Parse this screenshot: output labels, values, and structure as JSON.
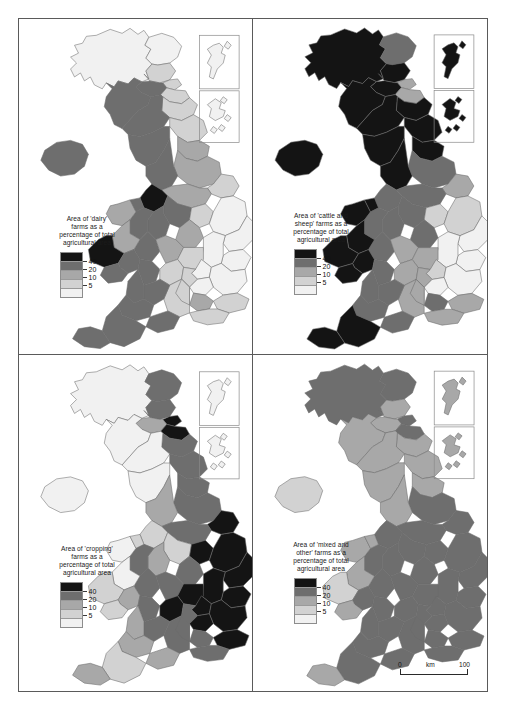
{
  "figure": {
    "panel_count": 4,
    "border_color": "#5a5a5a"
  },
  "legend_classes": [
    {
      "label": "40",
      "color": "#141414",
      "range": "over 40"
    },
    {
      "label": "20",
      "color": "#6e6e6e",
      "range": "20 to 40"
    },
    {
      "label": "10",
      "color": "#a8a8a8",
      "range": "10 to 20"
    },
    {
      "label": "5",
      "color": "#d2d2d2",
      "range": "5 to 10"
    },
    {
      "label": "",
      "color": "#f1f1f1",
      "range": "under 5"
    }
  ],
  "scalebar": {
    "left_label": "0",
    "unit_label": "km",
    "right_label": "100"
  },
  "panels": [
    {
      "id": "dairy",
      "legend_title": "Area of 'dairy'\nfarms as a\npercentage of total\nagricultural area",
      "inset_labels": [
        "shetland-inset",
        "orkney-inset"
      ]
    },
    {
      "id": "cattle-and-sheep",
      "legend_title": "Area of 'cattle and\nsheep' farms as a\npercentage of total\nagricultural area",
      "inset_labels": [
        "shetland-inset",
        "orkney-inset"
      ]
    },
    {
      "id": "cropping",
      "legend_title": "Area of 'cropping'\nfarms as a\npercentage of total\nagricultural area",
      "inset_labels": [
        "shetland-inset",
        "orkney-inset"
      ]
    },
    {
      "id": "mixed-and-other",
      "legend_title": "Area of 'mixed and\nother' farms as a\npercentage of total\nagricultural area",
      "inset_labels": [
        "shetland-inset",
        "orkney-inset"
      ]
    }
  ],
  "chart_data": {
    "type": "heatmap",
    "subtitle": "Choropleth maps of the United Kingdom, four farm types",
    "legend_breaks": [
      5,
      10,
      20,
      40
    ],
    "legend_position": "lower-left of each panel",
    "regions": [
      "Highland",
      "Grampian",
      "Tayside",
      "Fife",
      "Central",
      "Lothian",
      "Strathclyde",
      "Borders",
      "Dumfries and Galloway",
      "Northern Ireland",
      "Northumberland",
      "Cumbria",
      "Durham",
      "North Yorkshire",
      "Humberside",
      "Lancashire",
      "West Yorkshire",
      "Cheshire",
      "Derbyshire",
      "Nottinghamshire",
      "Lincolnshire",
      "Staffordshire",
      "Leicestershire",
      "Norfolk",
      "Suffolk",
      "Cambridgeshire",
      "Shropshire",
      "Hereford and Worcester",
      "Warwickshire",
      "Northamptonshire",
      "Bedfordshire",
      "Essex",
      "Gwynedd",
      "Clwyd",
      "Powys",
      "Dyfed",
      "Gwent",
      "Glamorgan",
      "Gloucestershire",
      "Oxfordshire",
      "Buckinghamshire",
      "Hertfordshire",
      "Kent",
      "Surrey",
      "Sussex",
      "Hampshire",
      "Berkshire",
      "Wiltshire",
      "Avon",
      "Somerset",
      "Dorset",
      "Devon",
      "Cornwall",
      "Shetland",
      "Orkney"
    ],
    "series": [
      {
        "name": "dairy",
        "title": "Area of 'dairy' farms as a percentage of total agricultural area",
        "values": {
          "Highland": 2,
          "Grampian": 4,
          "Tayside": 5,
          "Fife": 8,
          "Central": 22,
          "Lothian": 6,
          "Strathclyde": 28,
          "Borders": 5,
          "Dumfries and Galloway": 30,
          "Northern Ireland": 28,
          "Northumberland": 7,
          "Cumbria": 30,
          "Durham": 12,
          "North Yorkshire": 14,
          "Humberside": 5,
          "Lancashire": 33,
          "West Yorkshire": 16,
          "Cheshire": 48,
          "Derbyshire": 30,
          "Nottinghamshire": 8,
          "Lincolnshire": 3,
          "Staffordshire": 30,
          "Leicestershire": 12,
          "Norfolk": 2,
          "Suffolk": 2,
          "Cambridgeshire": 2,
          "Shropshire": 26,
          "Hereford and Worcester": 20,
          "Warwickshire": 14,
          "Northamptonshire": 8,
          "Bedfordshire": 3,
          "Essex": 2,
          "Gwynedd": 13,
          "Clwyd": 25,
          "Powys": 18,
          "Dyfed": 45,
          "Gwent": 22,
          "Glamorgan": 22,
          "Gloucestershire": 20,
          "Oxfordshire": 7,
          "Buckinghamshire": 9,
          "Hertfordshire": 3,
          "Kent": 6,
          "Surrey": 10,
          "Sussex": 9,
          "Hampshire": 8,
          "Berkshire": 8,
          "Wiltshire": 24,
          "Avon": 24,
          "Somerset": 30,
          "Dorset": 26,
          "Devon": 26,
          "Cornwall": 28,
          "Shetland": 1,
          "Orkney": 2
        }
      },
      {
        "name": "cattle-and-sheep",
        "title": "Area of 'cattle and sheep' farms as a percentage of total agricultural area",
        "values": {
          "Highland": 70,
          "Grampian": 30,
          "Tayside": 42,
          "Fife": 14,
          "Central": 60,
          "Lothian": 16,
          "Strathclyde": 72,
          "Borders": 55,
          "Dumfries and Galloway": 55,
          "Northern Ireland": 60,
          "Northumberland": 55,
          "Cumbria": 70,
          "Durham": 45,
          "North Yorkshire": 30,
          "Humberside": 12,
          "Lancashire": 45,
          "West Yorkshire": 32,
          "Cheshire": 22,
          "Derbyshire": 30,
          "Nottinghamshire": 9,
          "Lincolnshire": 5,
          "Staffordshire": 24,
          "Leicestershire": 22,
          "Norfolk": 4,
          "Suffolk": 4,
          "Cambridgeshire": 3,
          "Shropshire": 26,
          "Hereford and Worcester": 25,
          "Warwickshire": 16,
          "Northamptonshire": 14,
          "Bedfordshire": 5,
          "Essex": 4,
          "Gwynedd": 70,
          "Clwyd": 48,
          "Powys": 65,
          "Dyfed": 40,
          "Gwent": 42,
          "Glamorgan": 48,
          "Gloucestershire": 22,
          "Oxfordshire": 10,
          "Buckinghamshire": 12,
          "Hertfordshire": 4,
          "Kent": 12,
          "Surrey": 20,
          "Sussex": 16,
          "Hampshire": 12,
          "Berkshire": 12,
          "Wiltshire": 20,
          "Avon": 24,
          "Somerset": 30,
          "Dorset": 26,
          "Devon": 42,
          "Cornwall": 42,
          "Shetland": 85,
          "Orkney": 75
        }
      },
      {
        "name": "cropping",
        "title": "Area of 'cropping' farms as a percentage of total agricultural area",
        "values": {
          "Highland": 2,
          "Grampian": 22,
          "Tayside": 35,
          "Fife": 45,
          "Central": 12,
          "Lothian": 46,
          "Strathclyde": 4,
          "Borders": 24,
          "Dumfries and Galloway": 4,
          "Northern Ireland": 4,
          "Northumberland": 22,
          "Cumbria": 4,
          "Durham": 25,
          "North Yorkshire": 30,
          "Humberside": 55,
          "Lancashire": 14,
          "West Yorkshire": 24,
          "Cheshire": 6,
          "Derbyshire": 8,
          "Nottinghamshire": 45,
          "Lincolnshire": 65,
          "Staffordshire": 14,
          "Leicestershire": 28,
          "Norfolk": 70,
          "Suffolk": 70,
          "Cambridgeshire": 72,
          "Shropshire": 20,
          "Hereford and Worcester": 22,
          "Warwickshire": 35,
          "Northamptonshire": 42,
          "Bedfordshire": 60,
          "Essex": 68,
          "Gwynedd": 3,
          "Clwyd": 8,
          "Powys": 4,
          "Dyfed": 5,
          "Gwent": 14,
          "Glamorgan": 8,
          "Gloucestershire": 22,
          "Oxfordshire": 42,
          "Buckinghamshire": 38,
          "Hertfordshire": 62,
          "Kent": 42,
          "Surrey": 22,
          "Sussex": 30,
          "Hampshire": 35,
          "Berkshire": 35,
          "Wiltshire": 24,
          "Avon": 18,
          "Somerset": 10,
          "Dorset": 18,
          "Devon": 8,
          "Cornwall": 12,
          "Shetland": 1,
          "Orkney": 2
        }
      },
      {
        "name": "mixed-and-other",
        "title": "Area of 'mixed and other' farms as a percentage of total agricultural area",
        "values": {
          "Highland": 24,
          "Grampian": 26,
          "Tayside": 18,
          "Fife": 22,
          "Central": 14,
          "Lothian": 24,
          "Strathclyde": 12,
          "Borders": 16,
          "Dumfries and Galloway": 10,
          "Northern Ireland": 8,
          "Northumberland": 14,
          "Cumbria": 12,
          "Durham": 16,
          "North Yorkshire": 22,
          "Humberside": 22,
          "Lancashire": 10,
          "West Yorkshire": 24,
          "Cheshire": 22,
          "Derbyshire": 26,
          "Nottinghamshire": 30,
          "Lincolnshire": 22,
          "Staffordshire": 26,
          "Leicestershire": 30,
          "Norfolk": 22,
          "Suffolk": 22,
          "Cambridgeshire": 20,
          "Shropshire": 26,
          "Hereford and Worcester": 30,
          "Warwickshire": 30,
          "Northamptonshire": 30,
          "Bedfordshire": 26,
          "Essex": 22,
          "Gwynedd": 12,
          "Clwyd": 16,
          "Powys": 12,
          "Dyfed": 9,
          "Gwent": 20,
          "Glamorgan": 18,
          "Gloucestershire": 30,
          "Oxfordshire": 30,
          "Buckinghamshire": 28,
          "Hertfordshire": 24,
          "Kent": 26,
          "Surrey": 30,
          "Sussex": 26,
          "Hampshire": 30,
          "Berkshire": 30,
          "Wiltshire": 28,
          "Avon": 28,
          "Somerset": 26,
          "Dorset": 28,
          "Devon": 20,
          "Cornwall": 16,
          "Shetland": 10,
          "Orkney": 18
        }
      }
    ]
  }
}
